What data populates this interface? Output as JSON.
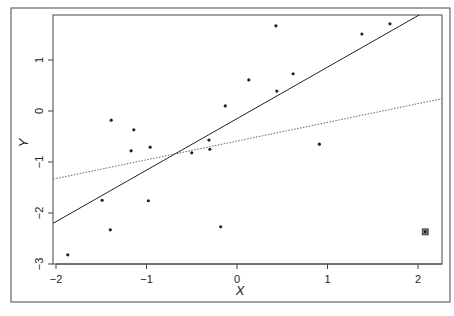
{
  "chart_data": {
    "type": "scatter",
    "title": "",
    "xlabel": "X",
    "ylabel": "Y",
    "xlim": [
      -2.03,
      2.27
    ],
    "ylim": [
      -3.0,
      1.88
    ],
    "grid": false,
    "legend": null,
    "x_ticks": [
      -2,
      -1,
      0,
      1,
      2
    ],
    "x_tick_labels": [
      "−2",
      "−1",
      "0",
      "1",
      "2"
    ],
    "y_ticks": [
      -3,
      -2,
      -1,
      0,
      1
    ],
    "y_tick_labels": [
      "−3",
      "−2",
      "−1",
      "0",
      "1"
    ],
    "points": [
      {
        "x": -1.87,
        "y": -2.82
      },
      {
        "x": -1.49,
        "y": -1.75
      },
      {
        "x": -1.4,
        "y": -2.33
      },
      {
        "x": -1.39,
        "y": -0.18
      },
      {
        "x": -1.17,
        "y": -0.78
      },
      {
        "x": -1.14,
        "y": -0.37
      },
      {
        "x": -0.98,
        "y": -1.76
      },
      {
        "x": -0.96,
        "y": -0.71
      },
      {
        "x": -0.5,
        "y": -0.82
      },
      {
        "x": -0.31,
        "y": -0.57
      },
      {
        "x": -0.3,
        "y": -0.75
      },
      {
        "x": -0.18,
        "y": -2.27
      },
      {
        "x": -0.13,
        "y": 0.1
      },
      {
        "x": 0.13,
        "y": 0.61
      },
      {
        "x": 0.43,
        "y": 1.67
      },
      {
        "x": 0.44,
        "y": 0.39
      },
      {
        "x": 0.62,
        "y": 0.73
      },
      {
        "x": 0.91,
        "y": -0.65
      },
      {
        "x": 1.38,
        "y": 1.51
      },
      {
        "x": 1.69,
        "y": 1.71
      }
    ],
    "outliers": [
      {
        "x": 2.08,
        "y": -2.37,
        "marker": "boxed-point"
      }
    ],
    "lines": [
      {
        "name": "fit-without-outlier",
        "style": "solid",
        "slope": 1.01,
        "intercept": -0.15
      },
      {
        "name": "fit-with-outlier",
        "style": "dotted",
        "slope": 0.367,
        "intercept": -0.59
      }
    ]
  },
  "layout": {
    "frame": {
      "x": 11,
      "y": 8,
      "w": 439,
      "h": 294
    },
    "plot": {
      "left": 53,
      "top": 15,
      "right": 442,
      "bottom": 264
    },
    "x_map": {
      "origin_px": 237,
      "px_per_unit": 90.5
    },
    "y_map": {
      "origin_px": 111,
      "px_per_unit": 51
    }
  },
  "colors": {
    "ink": "#222222",
    "frame": "#555555",
    "dotted_line": "#555555"
  }
}
